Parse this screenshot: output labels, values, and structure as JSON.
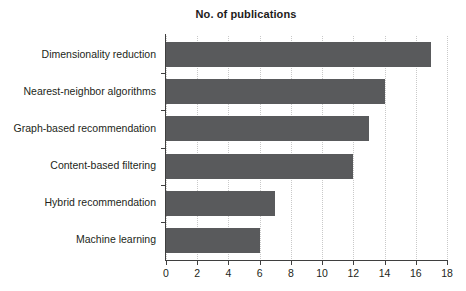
{
  "chart_data": {
    "type": "bar",
    "orientation": "horizontal",
    "title": "No. of publications",
    "xlabel": "",
    "ylabel": "",
    "categories": [
      "Dimensionality reduction",
      "Nearest-neighbor algorithms",
      "Graph-based recommendation",
      "Content-based filtering",
      "Hybrid recommendation",
      "Machine learning"
    ],
    "values": [
      17,
      14,
      13,
      12,
      7,
      6
    ],
    "xlim": [
      0,
      18
    ],
    "xticks": [
      0,
      2,
      4,
      6,
      8,
      10,
      12,
      14,
      16,
      18
    ],
    "xtick_labels": [
      "0",
      "2",
      "4",
      "6",
      "8",
      "10",
      "12",
      "14",
      "16",
      "18"
    ],
    "grid": true,
    "grid_axis": "x",
    "legend": false,
    "bar_color": "#595a5c",
    "grid_color": "#c9c9c9",
    "axis_color": "#3f3f3f",
    "background": "#ffffff"
  }
}
